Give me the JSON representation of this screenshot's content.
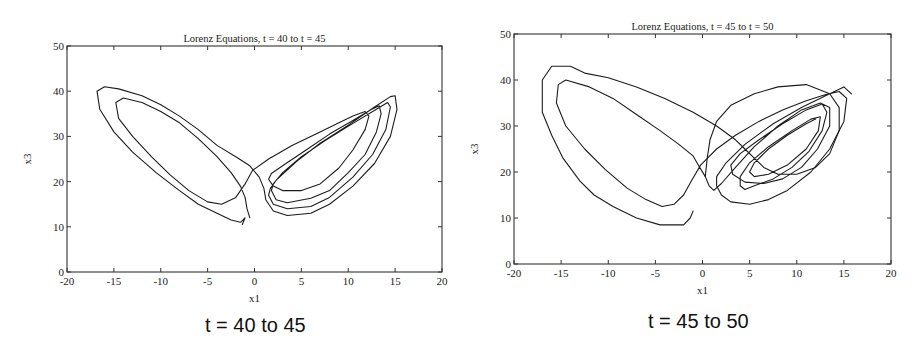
{
  "chart_data": [
    {
      "type": "line",
      "title": "Lorenz Equations, t = 40 to t = 45",
      "caption": "t = 40 to 45",
      "xlabel": "x1",
      "ylabel": "x3",
      "xlim": [
        -20,
        20
      ],
      "ylim": [
        0,
        50
      ],
      "xticks": [
        -20,
        -15,
        -10,
        -5,
        0,
        5,
        10,
        15,
        20
      ],
      "yticks": [
        0,
        10,
        20,
        30,
        40,
        50
      ],
      "grid": false,
      "legend": null,
      "box": {
        "left": 67,
        "top": 46,
        "right": 442,
        "bottom": 272
      },
      "series": [
        {
          "name": "trajectory",
          "points": [
            [
              -0.5,
              12
            ],
            [
              -0.8,
              14
            ],
            [
              -1.0,
              16.5
            ],
            [
              -1.5,
              19
            ],
            [
              -2.5,
              22
            ],
            [
              -4,
              25.5
            ],
            [
              -6,
              29.5
            ],
            [
              -8,
              33
            ],
            [
              -10,
              35.5
            ],
            [
              -12,
              37.5
            ],
            [
              -14,
              38.5
            ],
            [
              -14.8,
              37.5
            ],
            [
              -14.5,
              34
            ],
            [
              -13,
              30
            ],
            [
              -11,
              25.5
            ],
            [
              -9,
              21.5
            ],
            [
              -7,
              18
            ],
            [
              -5,
              15.5
            ],
            [
              -3.5,
              15
            ],
            [
              -2,
              16.5
            ],
            [
              -1,
              19.5
            ],
            [
              -0.2,
              22.5
            ],
            [
              1.5,
              25
            ],
            [
              4,
              28
            ],
            [
              7,
              31
            ],
            [
              9,
              33
            ],
            [
              10.5,
              34.5
            ],
            [
              11.8,
              35.5
            ],
            [
              12.2,
              34.5
            ],
            [
              11.8,
              31.5
            ],
            [
              10.5,
              27
            ],
            [
              9,
              23
            ],
            [
              7,
              19.5
            ],
            [
              5,
              18
            ],
            [
              3,
              18
            ],
            [
              2,
              19
            ],
            [
              1.5,
              20.5
            ],
            [
              1.8,
              21.8
            ],
            [
              3,
              23.5
            ],
            [
              5.5,
              27
            ],
            [
              8,
              30.5
            ],
            [
              10.5,
              33.5
            ],
            [
              12.5,
              36
            ],
            [
              13.3,
              36.8
            ],
            [
              13.5,
              35
            ],
            [
              13,
              31
            ],
            [
              11.8,
              26
            ],
            [
              10,
              22
            ],
            [
              8,
              18
            ],
            [
              6,
              16.3
            ],
            [
              3.5,
              15.3
            ],
            [
              2.3,
              16
            ],
            [
              1.8,
              18
            ],
            [
              2,
              19.5
            ],
            [
              3,
              22
            ],
            [
              5,
              25.5
            ],
            [
              7.5,
              29
            ],
            [
              10.2,
              32.5
            ],
            [
              13,
              36
            ],
            [
              14.2,
              37.5
            ],
            [
              14.5,
              36.5
            ],
            [
              14,
              31.5
            ],
            [
              12.6,
              26
            ],
            [
              10.5,
              21
            ],
            [
              8,
              16.5
            ],
            [
              6,
              14.5
            ],
            [
              3.5,
              14
            ],
            [
              2,
              15
            ],
            [
              1.5,
              17
            ],
            [
              1.7,
              18.5
            ],
            [
              2.4,
              20.5
            ],
            [
              4.5,
              24.5
            ],
            [
              7,
              28.5
            ],
            [
              10,
              32.5
            ],
            [
              12.8,
              36.5
            ],
            [
              14.5,
              38.8
            ],
            [
              15,
              39
            ],
            [
              15.2,
              36
            ],
            [
              14.5,
              30
            ],
            [
              12.8,
              24
            ],
            [
              10.5,
              19
            ],
            [
              8,
              15
            ],
            [
              6,
              13
            ],
            [
              3.5,
              12.5
            ],
            [
              2,
              13.5
            ],
            [
              1.2,
              16
            ],
            [
              1,
              18.5
            ],
            [
              0.5,
              21
            ],
            [
              -0.5,
              23.5
            ],
            [
              -2,
              25.5
            ],
            [
              -4,
              28
            ],
            [
              -6,
              31.5
            ],
            [
              -8,
              34.5
            ],
            [
              -10,
              37
            ],
            [
              -12,
              39
            ],
            [
              -14.5,
              40.5
            ],
            [
              -16,
              41
            ],
            [
              -16.8,
              40
            ],
            [
              -16.5,
              36
            ],
            [
              -15,
              31
            ],
            [
              -13,
              26.5
            ],
            [
              -10.5,
              22
            ],
            [
              -8,
              18
            ],
            [
              -6,
              15
            ],
            [
              -4,
              13
            ],
            [
              -2.5,
              11.5
            ],
            [
              -1.5,
              11
            ],
            [
              -1,
              12
            ],
            [
              -1.3,
              10.5
            ]
          ]
        }
      ]
    },
    {
      "type": "line",
      "title": "Lorenz Equations, t = 45 to t = 50",
      "caption": "t = 45 to 50",
      "xlabel": "x1",
      "ylabel": "x3",
      "xlim": [
        -20,
        20
      ],
      "ylim": [
        0,
        50
      ],
      "xticks": [
        -20,
        -15,
        -10,
        -5,
        0,
        5,
        10,
        15,
        20
      ],
      "yticks": [
        0,
        10,
        20,
        30,
        40,
        50
      ],
      "grid": false,
      "legend": null,
      "box": {
        "left": 514,
        "top": 34,
        "right": 891,
        "bottom": 264
      },
      "series": [
        {
          "name": "trajectory",
          "points": [
            [
              -1,
              11.5
            ],
            [
              -1.3,
              10
            ],
            [
              -2,
              8.5
            ],
            [
              -4.5,
              8.5
            ],
            [
              -7,
              10
            ],
            [
              -9.5,
              12.5
            ],
            [
              -11.5,
              15
            ],
            [
              -13,
              18
            ],
            [
              -14.8,
              23
            ],
            [
              -16,
              28
            ],
            [
              -17,
              33
            ],
            [
              -17,
              40
            ],
            [
              -16,
              43
            ],
            [
              -14,
              43
            ],
            [
              -12.5,
              41.5
            ],
            [
              -10,
              40.5
            ],
            [
              -7,
              38.5
            ],
            [
              -4,
              36
            ],
            [
              -1,
              33
            ],
            [
              1.5,
              30
            ],
            [
              3.5,
              27
            ],
            [
              4.5,
              25
            ],
            [
              5.5,
              23
            ],
            [
              6.5,
              21
            ],
            [
              8,
              19.5
            ],
            [
              10,
              19.5
            ],
            [
              12,
              21
            ],
            [
              13.5,
              24
            ],
            [
              14.5,
              29
            ],
            [
              14.5,
              34
            ],
            [
              13.5,
              37
            ],
            [
              11,
              39
            ],
            [
              8,
              38.5
            ],
            [
              5.5,
              37
            ],
            [
              3,
              34.5
            ],
            [
              1.5,
              31
            ],
            [
              0.8,
              27
            ],
            [
              0.5,
              23
            ],
            [
              0.3,
              19
            ],
            [
              0.7,
              17
            ],
            [
              1.2,
              16
            ],
            [
              2,
              17.5
            ],
            [
              3.5,
              21
            ],
            [
              5.5,
              25.5
            ],
            [
              8,
              30
            ],
            [
              10.5,
              33.5
            ],
            [
              12.5,
              35
            ],
            [
              13.5,
              34
            ],
            [
              13.5,
              30
            ],
            [
              12.2,
              25
            ],
            [
              10.5,
              21
            ],
            [
              8.5,
              18.5
            ],
            [
              6.5,
              17.5
            ],
            [
              4.5,
              17.8
            ],
            [
              3.2,
              19.5
            ],
            [
              3,
              21.5
            ],
            [
              4,
              24
            ],
            [
              6,
              27
            ],
            [
              8.5,
              30.5
            ],
            [
              11,
              33.5
            ],
            [
              12.7,
              34.8
            ],
            [
              13.2,
              33
            ],
            [
              12.7,
              29
            ],
            [
              11.3,
              24.5
            ],
            [
              9.5,
              21
            ],
            [
              7.5,
              18.5
            ],
            [
              5.5,
              17
            ],
            [
              4.5,
              16.2
            ],
            [
              4,
              17
            ],
            [
              4,
              19
            ],
            [
              5,
              22
            ],
            [
              7,
              25.5
            ],
            [
              9.5,
              29
            ],
            [
              11.5,
              31.5
            ],
            [
              12.5,
              32
            ],
            [
              12.3,
              29
            ],
            [
              11,
              25
            ],
            [
              9,
              21.5
            ],
            [
              7,
              19.5
            ],
            [
              5.5,
              19
            ],
            [
              5,
              20
            ],
            [
              5.5,
              22
            ],
            [
              7,
              25
            ],
            [
              9,
              28
            ],
            [
              11,
              30.5
            ],
            [
              12,
              31.5
            ]
          ]
        },
        {
          "name": "trajectory-left-lobe",
          "points": [
            [
              0.3,
              19
            ],
            [
              -0.3,
              21
            ],
            [
              -1,
              23.5
            ],
            [
              -2.5,
              26
            ],
            [
              -4.5,
              29
            ],
            [
              -7,
              32.5
            ],
            [
              -9.5,
              36
            ],
            [
              -12,
              38.5
            ],
            [
              -14.5,
              40
            ],
            [
              -15.3,
              39
            ],
            [
              -15.5,
              35
            ],
            [
              -14.5,
              30
            ],
            [
              -12.5,
              25
            ],
            [
              -10.3,
              20.5
            ],
            [
              -8,
              16.5
            ],
            [
              -6,
              14
            ],
            [
              -4.3,
              12.5
            ],
            [
              -3,
              13
            ],
            [
              -2,
              15
            ],
            [
              -1.2,
              18
            ],
            [
              -0.2,
              21.5
            ],
            [
              1.5,
              25
            ],
            [
              3.5,
              28
            ],
            [
              6,
              31
            ],
            [
              8.5,
              33.5
            ],
            [
              11,
              35.5
            ],
            [
              13,
              36.8
            ],
            [
              14.5,
              37.5
            ],
            [
              15.3,
              36
            ],
            [
              15,
              31
            ],
            [
              13.5,
              25
            ],
            [
              11.5,
              20
            ],
            [
              9,
              16
            ],
            [
              7,
              14
            ],
            [
              5,
              13
            ],
            [
              3,
              13.5
            ],
            [
              2,
              15
            ],
            [
              1.5,
              17
            ],
            [
              1.5,
              19
            ],
            [
              2.5,
              22
            ],
            [
              4.5,
              26
            ],
            [
              7.5,
              30.5
            ],
            [
              10.5,
              34
            ],
            [
              13,
              36.5
            ],
            [
              15,
              38.5
            ],
            [
              15.8,
              37
            ]
          ]
        }
      ]
    }
  ]
}
